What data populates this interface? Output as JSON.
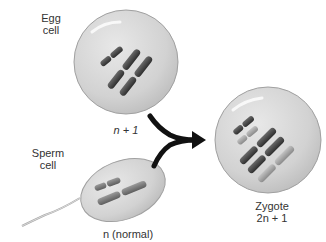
{
  "labels": {
    "egg_line1": "Egg",
    "egg_line2": "cell",
    "egg_count": "n + 1",
    "sperm_line1": "Sperm",
    "sperm_line2": "cell",
    "sperm_count": "n (normal)",
    "zygote_line1": "Zygote",
    "zygote_count": "2n + 1"
  },
  "cells": {
    "egg": {
      "name": "Egg cell",
      "ploidy": "n + 1",
      "chromosomes": 3
    },
    "sperm": {
      "name": "Sperm cell",
      "ploidy": "n (normal)",
      "chromosomes": 2
    },
    "zygote": {
      "name": "Zygote",
      "ploidy": "2n + 1",
      "chromosomes": 5
    }
  },
  "colors": {
    "cell_fill": "#d6d6d6",
    "cell_stroke": "#9a9a9a",
    "chromosome_dark": "#4a4a4a",
    "chromosome_medium": "#7a7a7a",
    "chromosome_light": "#a8a8a8",
    "arrow": "#111111"
  }
}
